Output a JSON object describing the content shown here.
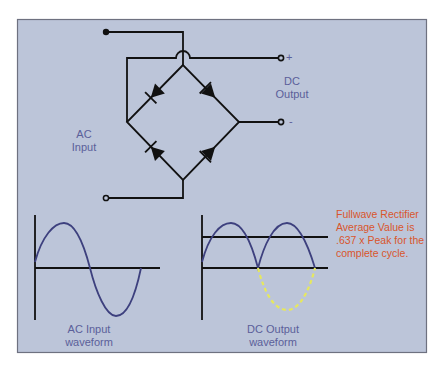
{
  "colors": {
    "panel_bg": "#bcc5d9",
    "panel_border": "#6e7180",
    "wire": "#111111",
    "waveform": "#3d407e",
    "label": "#5b5f99",
    "annotation": "#d9552c",
    "negative_half_dashed": "#e6e85e"
  },
  "circuit": {
    "title": "Full-wave bridge rectifier",
    "ac_input_label_line1": "AC",
    "ac_input_label_line2": "Input",
    "dc_output_label_line1": "DC",
    "dc_output_label_line2": "Output",
    "positive_terminal": "+",
    "negative_terminal": "-",
    "diode_count": 4
  },
  "waveforms": {
    "ac_caption_line1": "AC Input",
    "ac_caption_line2": "waveform",
    "dc_caption_line1": "DC Output",
    "dc_caption_line2": "waveform"
  },
  "annotation": {
    "line1": "Fullwave Rectifier",
    "line2": "Average Value is",
    "line3": ".637 x Peak for the",
    "line4": "complete cycle."
  }
}
